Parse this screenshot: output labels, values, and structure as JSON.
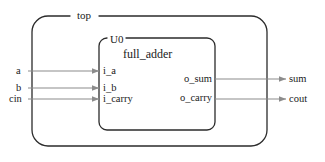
{
  "diagram": {
    "type": "hdl-hierarchy-block-diagram",
    "outer_module": {
      "name": "top"
    },
    "inner_instance": {
      "instance_label": "U0",
      "module_name": "full_adder"
    },
    "ports": {
      "top_inputs": [
        {
          "name": "a",
          "connects_to": "i_a"
        },
        {
          "name": "b",
          "connects_to": "i_b"
        },
        {
          "name": "cin",
          "connects_to": "i_carry"
        }
      ],
      "top_outputs": [
        {
          "name": "sum",
          "driven_by": "o_sum"
        },
        {
          "name": "cout",
          "driven_by": "o_carry"
        }
      ],
      "instance_inputs": [
        {
          "name": "i_a"
        },
        {
          "name": "i_b"
        },
        {
          "name": "i_carry"
        }
      ],
      "instance_outputs": [
        {
          "name": "o_sum"
        },
        {
          "name": "o_carry"
        }
      ]
    },
    "colors": {
      "border": "#2b2b2b",
      "wire": "#8c8c8c",
      "arrow": "#8c8c8c",
      "text": "#1a1a1a",
      "background": "#ffffff"
    }
  }
}
